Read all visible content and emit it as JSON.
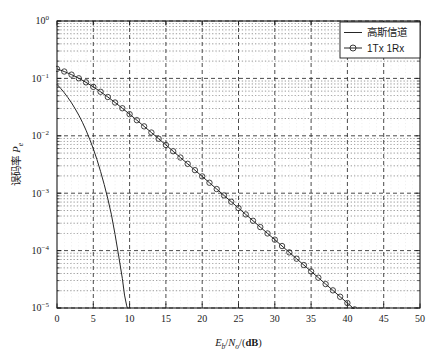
{
  "chart_data": {
    "type": "line",
    "title": "",
    "xlabel": "Eb/No/(dB)",
    "ylabel": "误码率 Pe",
    "xlabel_parts": {
      "main1": "E",
      "sub1": "b",
      "slash1": "/",
      "main2": "N",
      "sub2": "o",
      "tail": "/(dB)"
    },
    "ylabel_parts": {
      "cjk": "误码率",
      "main": "P",
      "sub": "e"
    },
    "xlim": [
      0,
      50
    ],
    "ylim": [
      1e-05,
      1
    ],
    "yscale": "log",
    "xscale": "linear",
    "grid": true,
    "grid_style": "dashed major and minor",
    "legend_position": "top-right",
    "xticks": [
      0,
      5,
      10,
      15,
      20,
      25,
      30,
      35,
      40,
      45,
      50
    ],
    "xtick_labels": [
      "0",
      "5",
      "10",
      "15",
      "20",
      "25",
      "30",
      "35",
      "40",
      "45",
      "50"
    ],
    "yticks": [
      1,
      0.1,
      0.01,
      0.001,
      0.0001,
      1e-05
    ],
    "ytick_labels": [
      "10⁰",
      "10⁻¹",
      "10⁻²",
      "10⁻³",
      "10⁻⁴",
      "10⁻⁵"
    ],
    "ytick_mantissa": [
      "10",
      "10",
      "10",
      "10",
      "10",
      "10"
    ],
    "ytick_exponents": [
      "0",
      "-1",
      "-2",
      "-3",
      "-4",
      "-5"
    ],
    "series": [
      {
        "name": "高斯信道",
        "label": "高斯信道",
        "marker": "none",
        "color": "#262626",
        "linewidth": 1.0,
        "x": [
          0,
          0.5,
          1,
          1.5,
          2,
          2.5,
          3,
          3.5,
          4,
          4.5,
          5,
          5.5,
          6,
          6.5,
          7,
          7.5,
          8,
          8.5,
          9,
          9.3,
          9.6,
          9.7
        ],
        "y": [
          0.0786,
          0.0671,
          0.0563,
          0.0463,
          0.0375,
          0.0296,
          0.0229,
          0.0172,
          0.0125,
          0.00875,
          0.00595,
          0.00387,
          0.0024,
          0.00142,
          0.0008,
          0.00042,
          0.00019,
          8e-05,
          3.28e-05,
          1.68e-05,
          1.09e-05,
          1e-05
        ]
      },
      {
        "name": "1Tx 1Rx",
        "label": "1Tx 1Rx",
        "marker": "circle",
        "color": "#262626",
        "linewidth": 1.0,
        "x": [
          0,
          1,
          2,
          3,
          4,
          5,
          6,
          7,
          8,
          9,
          10,
          11,
          12,
          13,
          14,
          15,
          16,
          17,
          18,
          19,
          20,
          21,
          22,
          23,
          24,
          25,
          26,
          27,
          28,
          29,
          30,
          31,
          32,
          33,
          34,
          35,
          36,
          37,
          38,
          39,
          40,
          41,
          42,
          43,
          44
        ],
        "y": [
          0.1464,
          0.1318,
          0.1163,
          0.1005,
          0.0853,
          0.0712,
          0.0585,
          0.0474,
          0.038,
          0.0302,
          0.0238,
          0.0187,
          0.0146,
          0.0114,
          0.00889,
          0.00692,
          0.00538,
          0.00418,
          0.00325,
          0.00252,
          0.00196,
          0.00152,
          0.00118,
          0.000915,
          0.00071,
          0.000551,
          0.000427,
          0.000331,
          0.000257,
          0.000199,
          0.000155,
          0.00012,
          9.31e-05,
          7.22e-05,
          5.6e-05,
          4.34e-05,
          3.37e-05,
          2.61e-05,
          2.03e-05,
          1.57e-05,
          1.22e-05,
          9.45e-06,
          7.33e-06,
          5.68e-06,
          4.4e-06
        ]
      }
    ],
    "legend_entries": [
      {
        "label": "高斯信道",
        "marker": "none",
        "is_cjk": true
      },
      {
        "label": "1Tx 1Rx",
        "marker": "circle",
        "is_cjk": false
      }
    ]
  }
}
